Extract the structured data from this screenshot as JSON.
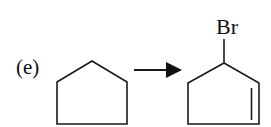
{
  "diagram": {
    "type": "chemical-reaction-scheme",
    "part_label": "(e)",
    "reactant": {
      "name": "cyclopentane",
      "ring_size": 5,
      "substituents": []
    },
    "arrow": {
      "direction": "right",
      "style": "solid-filled-head"
    },
    "product": {
      "name": "3-bromocyclopentene",
      "ring_size": 5,
      "substituent_label": "Br",
      "double_bond": "right ring edge"
    },
    "colors": {
      "ink": "#1a1a1a",
      "background": "#ffffff"
    }
  }
}
